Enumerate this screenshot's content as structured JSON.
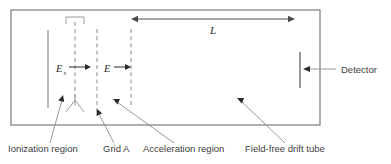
{
  "figure": {
    "background_color": "#ffffff",
    "line_color": "#6e6e6e"
  },
  "chamber": {
    "name": "vacuum-chamber-outline",
    "x": 11,
    "y": 10,
    "width": 309,
    "height": 115
  },
  "electrodes": [
    {
      "id": "backing-plate",
      "style": "solid",
      "x": 48,
      "y1": 30,
      "y2": 108
    },
    {
      "id": "ion-source-axis",
      "style": "dashed",
      "x": 75,
      "y1": 22,
      "y2": 108
    },
    {
      "id": "grid-a",
      "style": "dashed",
      "x": 97,
      "y1": 29,
      "y2": 112
    },
    {
      "id": "grid-b",
      "style": "dashed",
      "x": 131,
      "y1": 29,
      "y2": 108
    }
  ],
  "field_labels": [
    {
      "id": "extraction-field",
      "symbol": "E",
      "subscript": "s",
      "label_x": 56,
      "label_y": 72,
      "arrow_x1": 69,
      "arrow_x2": 90,
      "arrow_y": 67
    },
    {
      "id": "acceleration-field",
      "symbol": "E",
      "subscript": "",
      "label_x": 105,
      "label_y": 72,
      "arrow_x1": 115,
      "arrow_x2": 131,
      "arrow_y": 67
    }
  ],
  "dimension": {
    "id": "drift-length",
    "label": "L",
    "label_x": 213,
    "label_y": 33,
    "x1": 131,
    "x2": 295,
    "y": 19
  },
  "detector": {
    "id": "detector-plate",
    "bar_x": 300,
    "bar_y1": 52,
    "bar_y2": 88,
    "label": "Detector",
    "label_x": 342,
    "label_y": 72,
    "arrow_x1": 336,
    "arrow_x2": 304,
    "arrow_y": 69
  },
  "source_assembly": {
    "id": "ion-source-assembly",
    "top_bracket": {
      "left_x": 66,
      "right_x": 84,
      "top_y": 17,
      "leg_bottom_y": 24
    },
    "bottom_fork": {
      "apex_x": 75,
      "apex_y": 100,
      "left_x": 66,
      "right_x": 84,
      "bottom_y": 112
    }
  },
  "callouts": [
    {
      "id": "ionization-region",
      "label": "Ionization region",
      "text_x": 8,
      "text_y": 152,
      "leader_x1": 50,
      "leader_y1": 143,
      "leader_x2": 61,
      "leader_y2": 96
    },
    {
      "id": "grid-a",
      "label": "Grid A",
      "text_x": 103,
      "text_y": 152,
      "leader_x1": 114,
      "leader_y1": 143,
      "leader_x2": 98,
      "leader_y2": 110
    },
    {
      "id": "acceleration-region",
      "label": "Acceleration region",
      "text_x": 143,
      "text_y": 152,
      "leader_x1": 174,
      "leader_y1": 143,
      "leader_x2": 114,
      "leader_y2": 99
    },
    {
      "id": "field-free-drift-tube",
      "label": "Field-free drift tube",
      "text_x": 245,
      "text_y": 152,
      "leader_x1": 285,
      "leader_y1": 143,
      "leader_x2": 238,
      "leader_y2": 98
    }
  ]
}
